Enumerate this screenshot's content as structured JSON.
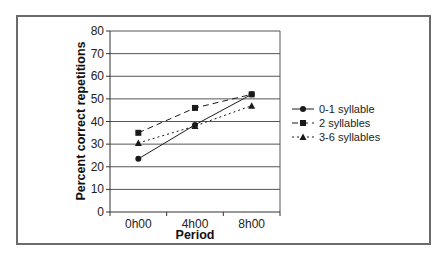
{
  "chart_data": {
    "type": "line",
    "title": "",
    "xlabel": "Period",
    "ylabel": "Percent correct repetitions",
    "categories": [
      "0h00",
      "4h00",
      "8h00"
    ],
    "ylim": [
      0,
      80
    ],
    "yticks": [
      0,
      10,
      20,
      30,
      40,
      50,
      60,
      70,
      80
    ],
    "grid": true,
    "legend_position": "right",
    "series": [
      {
        "name": "0-1 syllable",
        "values": [
          23.5,
          38.5,
          52
        ],
        "line": "solid",
        "marker": "circle"
      },
      {
        "name": "2 syllables",
        "values": [
          35,
          46,
          52
        ],
        "line": "dashed",
        "marker": "square"
      },
      {
        "name": "3-6 syllables",
        "values": [
          30.5,
          38,
          47
        ],
        "line": "dotted",
        "marker": "triangle"
      }
    ]
  },
  "colors": {
    "frame": "#6b6b6b",
    "grid": "#555555",
    "series": "#1a1a1a"
  }
}
